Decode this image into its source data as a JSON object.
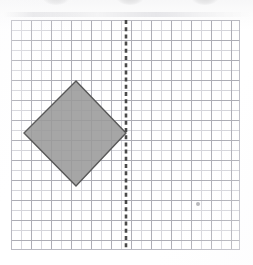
{
  "document": {
    "type": "math-worksheet-figure",
    "title": "Reflection of a square across a vertical line"
  },
  "canvas": {
    "width": 253,
    "height": 265,
    "background_color": "#ffffff"
  },
  "grid": {
    "label": "graph paper grid",
    "left": 11,
    "top": 20,
    "width": 229,
    "height": 230,
    "cell_size": 10,
    "columns": 23,
    "rows": 23,
    "major_every": 2,
    "minor_color": "#d3d3da",
    "major_color": "#a9a9b2",
    "border_color": "#b6b6be"
  },
  "mirror_line": {
    "label": "line of reflection",
    "orientation": "vertical",
    "x": 126,
    "y_start": 20,
    "y_end": 250,
    "style": "dashed",
    "color": "#4a4a4a",
    "stroke_width": 2.6,
    "dash_on": 4,
    "dash_off": 3.2
  },
  "shape": {
    "label": "shaded square rotated 45 degrees",
    "kind": "diamond",
    "fill_color": "#9a9a9a",
    "stroke_color": "#585858",
    "stroke_width": 1.4,
    "vertices": [
      {
        "name": "top",
        "x": 76,
        "y": 81
      },
      {
        "name": "right",
        "x": 126,
        "y": 133
      },
      {
        "name": "bottom",
        "x": 76,
        "y": 186
      },
      {
        "name": "left",
        "x": 24,
        "y": 133
      }
    ],
    "touches_mirror_line": true
  },
  "artifacts": {
    "stray_mark": {
      "label": "stray pencil dot",
      "x": 198,
      "y": 204,
      "color": "#a4a4a8"
    },
    "scan_blobs": [
      {
        "label": "scanner-edge shadow",
        "x": 56
      },
      {
        "label": "scanner-edge shadow",
        "x": 130
      },
      {
        "label": "scanner-edge shadow",
        "x": 205
      }
    ]
  }
}
